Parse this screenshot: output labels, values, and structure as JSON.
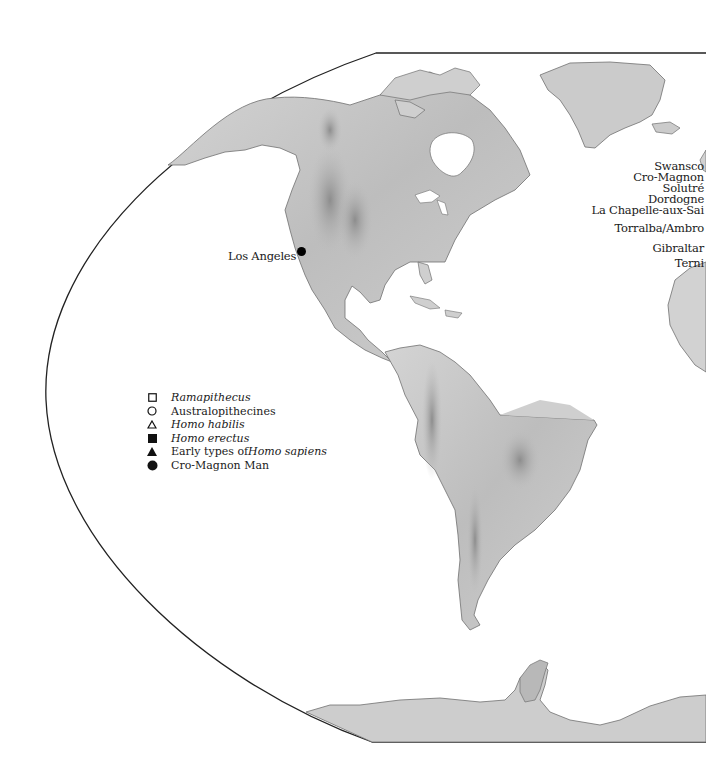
{
  "map": {
    "title": "",
    "colors": {
      "land": "#c9c9c9",
      "land_dark": "#9a9a9a",
      "coast": "#6e6e6e",
      "frame": "#222222",
      "water": "#ffffff",
      "text": "#1a1a1a"
    }
  },
  "cities": [
    {
      "name": "Los Angeles",
      "symbol": "Cro-Magnon Man"
    }
  ],
  "sites": [
    {
      "name": "Swansco"
    },
    {
      "name": "Cro-Magnon"
    },
    {
      "name": "Solutré"
    },
    {
      "name": "Dordogne"
    },
    {
      "name": "La Chapelle-aux-Sai"
    },
    {
      "name": "Torralba/Ambro"
    },
    {
      "name": "Gibraltar"
    },
    {
      "name": "Terni"
    }
  ],
  "legend": {
    "items": [
      {
        "symbol": "open-square",
        "pre": "",
        "italic": "Ramapithecus",
        "post": ""
      },
      {
        "symbol": "open-circle",
        "pre": "Australopithecines",
        "italic": "",
        "post": ""
      },
      {
        "symbol": "open-triangle",
        "pre": "",
        "italic": "Homo habilis",
        "post": ""
      },
      {
        "symbol": "filled-square",
        "pre": "",
        "italic": "Homo erectus",
        "post": ""
      },
      {
        "symbol": "filled-triangle",
        "pre": "Early types of ",
        "italic": "Homo sapiens",
        "post": ""
      },
      {
        "symbol": "filled-circle",
        "pre": "Cro-Magnon Man",
        "italic": "",
        "post": ""
      }
    ]
  }
}
